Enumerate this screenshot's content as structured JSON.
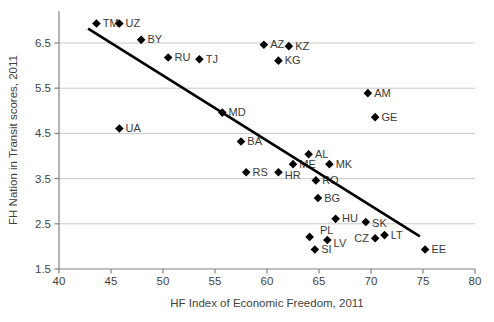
{
  "chart_data": {
    "type": "scatter",
    "title": "",
    "xlabel": "HF Index of Economic Freedom, 2011",
    "ylabel": "FH Nation in Transit scores, 2011",
    "xlim": [
      40,
      80
    ],
    "ylim": [
      1.5,
      7.2
    ],
    "x_ticks": [
      40,
      45,
      50,
      55,
      60,
      65,
      70,
      75,
      80
    ],
    "y_ticks": [
      1.5,
      2.5,
      3.5,
      4.5,
      5.5,
      6.5
    ],
    "grid": "horizontal",
    "legend": "none",
    "marker": "diamond",
    "points": [
      {
        "label": "TM",
        "x": 43.6,
        "y": 6.93
      },
      {
        "label": "UZ",
        "x": 45.8,
        "y": 6.93
      },
      {
        "label": "BY",
        "x": 47.9,
        "y": 6.57
      },
      {
        "label": "RU",
        "x": 50.5,
        "y": 6.18
      },
      {
        "label": "TJ",
        "x": 53.5,
        "y": 6.14
      },
      {
        "label": "AZ",
        "x": 59.7,
        "y": 6.46
      },
      {
        "label": "KZ",
        "x": 62.1,
        "y": 6.43
      },
      {
        "label": "KG",
        "x": 61.1,
        "y": 6.11
      },
      {
        "label": "AM",
        "x": 69.7,
        "y": 5.39
      },
      {
        "label": "GE",
        "x": 70.4,
        "y": 4.86
      },
      {
        "label": "UA",
        "x": 45.8,
        "y": 4.61
      },
      {
        "label": "MD",
        "x": 55.7,
        "y": 4.96
      },
      {
        "label": "BA",
        "x": 57.5,
        "y": 4.32
      },
      {
        "label": "AL",
        "x": 64.0,
        "y": 4.04
      },
      {
        "label": "ME",
        "x": 62.5,
        "y": 3.82
      },
      {
        "label": "MK",
        "x": 66.0,
        "y": 3.82
      },
      {
        "label": "RS",
        "x": 58.0,
        "y": 3.64
      },
      {
        "label": "HR",
        "x": 61.1,
        "y": 3.64,
        "label_dy": 3
      },
      {
        "label": "RO",
        "x": 64.7,
        "y": 3.46
      },
      {
        "label": "BG",
        "x": 64.9,
        "y": 3.07
      },
      {
        "label": "HU",
        "x": 66.6,
        "y": 2.61
      },
      {
        "label": "SK",
        "x": 69.5,
        "y": 2.54,
        "label_dy": 2
      },
      {
        "label": "PL",
        "x": 64.1,
        "y": 2.21,
        "label_dx": 4,
        "label_dy": -6
      },
      {
        "label": "LV",
        "x": 65.8,
        "y": 2.14,
        "label_dy": 3
      },
      {
        "label": "CZ",
        "x": 70.4,
        "y": 2.18,
        "label_side": "left"
      },
      {
        "label": "LT",
        "x": 71.3,
        "y": 2.25
      },
      {
        "label": "SI",
        "x": 64.6,
        "y": 1.93
      },
      {
        "label": "EE",
        "x": 75.2,
        "y": 1.93
      }
    ],
    "trendline": {
      "x1": 42.8,
      "y1": 6.82,
      "x2": 74.7,
      "y2": 2.22
    },
    "colors": {
      "marker": "#000000",
      "point_label": "#3a3a3a",
      "tick_label": "#3f3f3f",
      "grid": "#c9c9c9",
      "axis": "#808080",
      "trend": "#000000",
      "background": "#ffffff"
    }
  }
}
